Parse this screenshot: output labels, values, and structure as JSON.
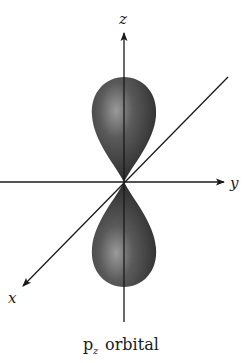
{
  "figure": {
    "type": "p-orbital diagram",
    "axes": {
      "z_label": "z",
      "y_label": "y",
      "x_label": "x"
    },
    "caption": {
      "main": "p",
      "subscript": "z",
      "rest": " orbital"
    },
    "colors": {
      "lobe_dark": "#2e2e2e",
      "lobe_mid": "#5a5a5a",
      "lobe_highlight": "#9a9a9a",
      "axis": "#1a1a1a",
      "background": "#ffffff"
    }
  }
}
